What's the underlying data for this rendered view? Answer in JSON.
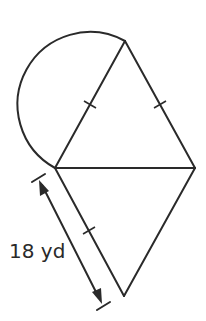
{
  "diagram": {
    "type": "composite-figure",
    "colors": {
      "stroke": "#2a2a2a",
      "background": "#ffffff"
    },
    "points": {
      "top": [
        125,
        41
      ],
      "left": [
        55,
        168
      ],
      "right": [
        195,
        168
      ],
      "bottom": [
        124,
        296
      ]
    },
    "semicircle": {
      "center": [
        90,
        104.5
      ],
      "radius": 72.5
    },
    "congruence_ticks": 3,
    "dimension": {
      "label": "18 yd",
      "start": [
        38,
        178
      ],
      "end": [
        103,
        306
      ]
    }
  }
}
